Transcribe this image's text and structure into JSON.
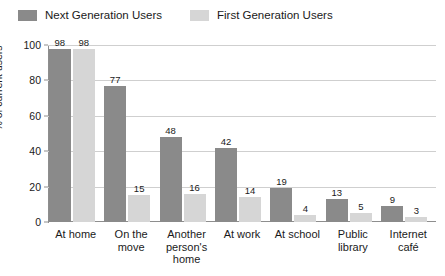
{
  "legend": {
    "entries": [
      {
        "label": "Next Generation Users",
        "color": "#8a8a8a",
        "swatch_name": "legend-swatch-next-generation"
      },
      {
        "label": "First Generation Users",
        "color": "#d6d6d6",
        "swatch_name": "legend-swatch-first-generation"
      }
    ]
  },
  "chart_data": {
    "type": "bar",
    "title": "",
    "subtitle": "",
    "xlabel": "",
    "ylabel": "% of current users",
    "ylim": [
      0,
      100
    ],
    "yticks": [
      0,
      20,
      40,
      60,
      80,
      100
    ],
    "ytick_labels": [
      "0",
      "20",
      "40",
      "60",
      "80",
      "100"
    ],
    "grid": true,
    "grid_axis": "y",
    "legend_position": "top-left",
    "categories": [
      "At home",
      "On the\nmove",
      "Another\nperson's\nhome",
      "At work",
      "At school",
      "Public\nlibrary",
      "Internet\ncafé"
    ],
    "series": [
      {
        "name": "Next Generation Users",
        "color": "#8a8a8a",
        "values": [
          98,
          77,
          48,
          42,
          19,
          13,
          9
        ]
      },
      {
        "name": "First Generation Users",
        "color": "#d6d6d6",
        "values": [
          98,
          15,
          16,
          14,
          4,
          5,
          3
        ]
      }
    ]
  },
  "colors": {
    "background": "#ffffff",
    "gridline": "#cfcfcf",
    "axis": "#8e8e8e",
    "text": "#1a1a1a"
  }
}
